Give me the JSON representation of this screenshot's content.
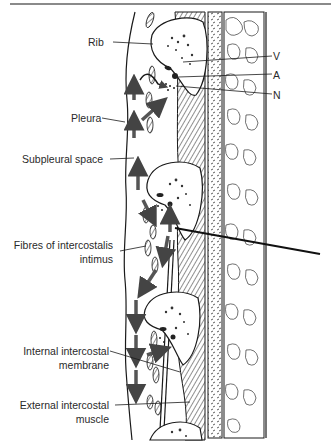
{
  "figure": {
    "type": "anatomical-diagram",
    "labels": {
      "rib": "Rib",
      "v": "V",
      "a": "A",
      "n": "N",
      "pleura": "Pleura",
      "subpleural_space": "Subpleural space",
      "fibres_line1": "Fibres of intercostalis",
      "fibres_line2": "intimus",
      "internal_line1": "Internal intercostal",
      "internal_line2": "membrane",
      "external_line1": "External intercostal",
      "external_line2": "muscle"
    },
    "colors": {
      "ink": "#1a1a1a",
      "arrow": "#555555",
      "rule": "#8a8a8a",
      "background": "#ffffff"
    }
  }
}
